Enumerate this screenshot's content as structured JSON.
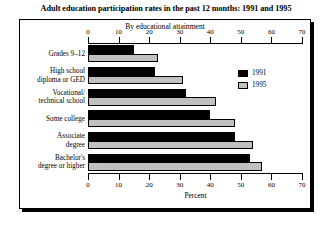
{
  "chart_data": {
    "type": "bar",
    "orientation": "horizontal",
    "title": "Adult education participation rates in the past 12 months: 1991 and 1995",
    "subtitle": "By educational attainment",
    "xlabel": "Percent",
    "ylabel": "",
    "xlim": [
      0,
      70
    ],
    "xticks": [
      0,
      10,
      20,
      30,
      40,
      50,
      60,
      70
    ],
    "grid": false,
    "legend_position": "right",
    "categories": [
      "Grades 9–12",
      "High school\ndiploma or GED",
      "Vocational/\ntechnical school",
      "Some college",
      "Associate\ndegree",
      "Bachelor's\ndegree or higher"
    ],
    "series": [
      {
        "name": "1991",
        "color": "#000000",
        "values": [
          15,
          22,
          32,
          40,
          48,
          53
        ]
      },
      {
        "name": "1995",
        "color": "#c0c0c0",
        "values": [
          23,
          31,
          42,
          48,
          54,
          57
        ]
      }
    ]
  },
  "axis": {
    "tick_labels": [
      "0",
      "10",
      "20",
      "30",
      "40",
      "50",
      "60",
      "70"
    ],
    "x_title": "Percent"
  },
  "categories": [
    {
      "line1": "Grades 9–12",
      "line2": ""
    },
    {
      "line1": "High school",
      "line2": "diploma or GED"
    },
    {
      "line1": "Vocational/",
      "line2": "technical school"
    },
    {
      "line1": "Some college",
      "line2": ""
    },
    {
      "line1": "Associate",
      "line2": "degree"
    },
    {
      "line1": "Bachelor's",
      "line2": "degree or higher"
    }
  ],
  "legend": {
    "items": [
      {
        "label": "1991",
        "color": "#000000"
      },
      {
        "label": "1995",
        "color": "#c0c0c0"
      }
    ]
  }
}
